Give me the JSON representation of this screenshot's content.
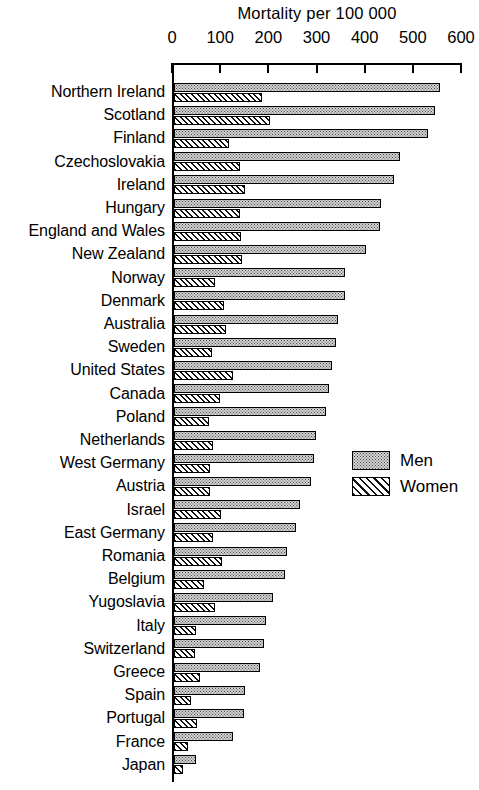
{
  "chart_data": {
    "type": "bar",
    "orientation": "horizontal",
    "title": "Mortality per 100 000",
    "xlabel": "",
    "ylabel": "",
    "xlim": [
      0,
      600
    ],
    "xticks": [
      0,
      100,
      200,
      300,
      400,
      500,
      600
    ],
    "xtick_labels": [
      "0",
      "100",
      "200",
      "300",
      "400",
      "500",
      "600"
    ],
    "grid": false,
    "legend_position": "right-middle",
    "categories": [
      "Northern Ireland",
      "Scotland",
      "Finland",
      "Czechoslovakia",
      "Ireland",
      "Hungary",
      "England and Wales",
      "New Zealand",
      "Norway",
      "Denmark",
      "Australia",
      "Sweden",
      "United States",
      "Canada",
      "Poland",
      "Netherlands",
      "West Germany",
      "Austria",
      "Israel",
      "East Germany",
      "Romania",
      "Belgium",
      "Yugoslavia",
      "Italy",
      "Switzerland",
      "Greece",
      "Spain",
      "Portugal",
      "France",
      "Japan"
    ],
    "series": [
      {
        "name": "Men",
        "color": "#d2d2d2",
        "pattern": "stipple",
        "values": [
          552,
          541,
          527,
          470,
          456,
          429,
          427,
          398,
          356,
          354,
          340,
          336,
          327,
          322,
          315,
          295,
          290,
          285,
          262,
          253,
          235,
          230,
          205,
          190,
          187,
          179,
          148,
          146,
          123,
          46
        ]
      },
      {
        "name": "Women",
        "color": "#ffffff",
        "pattern": "diagonal-hatch",
        "values": [
          183,
          200,
          115,
          138,
          148,
          138,
          140,
          142,
          85,
          104,
          108,
          78,
          122,
          95,
          72,
          80,
          75,
          74,
          97,
          80,
          100,
          62,
          86,
          46,
          44,
          55,
          35,
          48,
          30,
          18
        ]
      }
    ]
  },
  "axis": {
    "title": "Mortality per 100 000",
    "tick_labels": [
      "0",
      "100",
      "200",
      "300",
      "400",
      "500",
      "600"
    ]
  },
  "legend": {
    "items": [
      {
        "label": "Men",
        "pattern": "stipple"
      },
      {
        "label": "Women",
        "pattern": "diagonal-hatch"
      }
    ]
  }
}
